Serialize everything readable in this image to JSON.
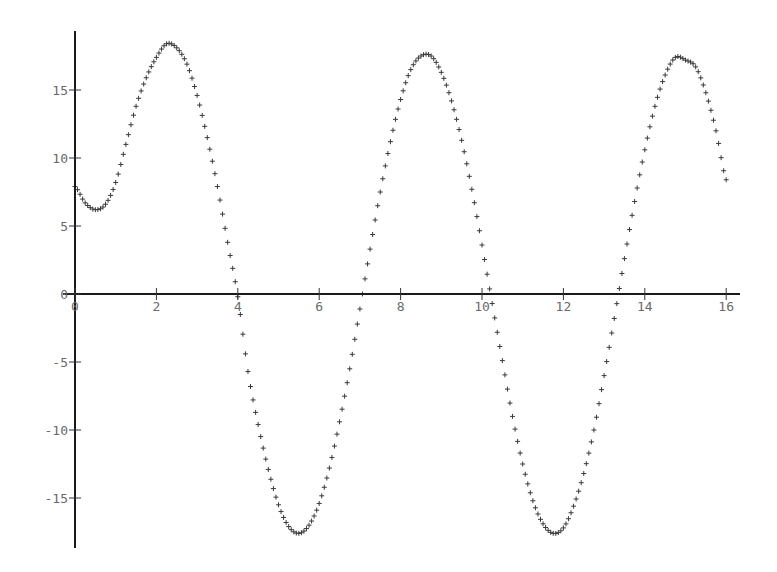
{
  "chart_data": {
    "type": "scatter",
    "title": "",
    "xlabel": "",
    "ylabel": "",
    "marker": "+",
    "marker_color": "#3a3a3a",
    "axis_color": "#1a1a1a",
    "tick_label_color": "#6a6a6a",
    "grid": false,
    "legend": null,
    "xlim": [
      0,
      16
    ],
    "ylim": [
      -18.7,
      19.3
    ],
    "x_ticks": [
      0,
      2,
      4,
      6,
      8,
      10,
      12,
      14,
      16
    ],
    "x_tick_labels": [
      "0",
      "2",
      "4",
      "6",
      "8",
      "10",
      "12",
      "14",
      "16"
    ],
    "y_ticks": [
      -15,
      -10,
      -5,
      0,
      5,
      10,
      15
    ],
    "y_tick_labels": [
      "-15",
      "-10",
      "-5",
      "0",
      "5",
      "10",
      "15"
    ],
    "x": [
      0,
      0.25,
      0.5,
      0.75,
      1.0,
      1.25,
      1.5,
      1.75,
      2.0,
      2.25,
      2.5,
      2.75,
      3.0,
      3.25,
      3.5,
      3.75,
      4.0,
      4.25,
      4.5,
      4.75,
      5.0,
      5.25,
      5.5,
      5.75,
      6.0,
      6.25,
      6.5,
      6.75,
      7.0,
      7.25,
      7.5,
      7.75,
      8.0,
      8.25,
      8.5,
      8.75,
      9.0,
      9.25,
      9.5,
      9.75,
      10.0,
      10.25,
      10.5,
      10.75,
      11.0,
      11.25,
      11.5,
      11.75,
      12.0,
      12.25,
      12.5,
      12.75,
      13.0,
      13.25,
      13.5,
      13.75,
      14.0,
      14.25,
      14.5,
      14.75,
      15.0,
      15.25,
      15.5,
      15.75,
      16.0
    ],
    "y": [
      7.9,
      6.7,
      6.2,
      6.6,
      8.2,
      11.0,
      13.8,
      15.9,
      17.4,
      18.4,
      18.1,
      16.9,
      14.6,
      11.5,
      7.9,
      3.8,
      -0.2,
      -5.7,
      -9.6,
      -12.9,
      -15.5,
      -17.1,
      -17.6,
      -17.0,
      -15.4,
      -12.8,
      -9.4,
      -5.5,
      -1.1,
      3.3,
      7.5,
      11.2,
      14.3,
      16.5,
      17.5,
      17.5,
      16.3,
      14.2,
      11.3,
      7.7,
      3.6,
      -0.7,
      -4.9,
      -9.0,
      -12.5,
      -15.2,
      -16.9,
      -17.6,
      -17.2,
      -15.6,
      -13.2,
      -10.0,
      -6.0,
      -1.8,
      2.6,
      6.8,
      10.6,
      13.8,
      16.1,
      17.4,
      17.2,
      16.7,
      14.8,
      12.0,
      8.4
    ]
  }
}
